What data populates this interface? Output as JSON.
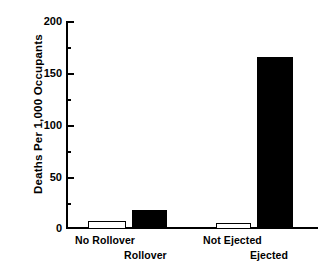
{
  "chart_data": {
    "type": "bar",
    "title": "",
    "xlabel": "",
    "ylabel": "Deaths Per 1,000 Occupants",
    "ylim": [
      0,
      200
    ],
    "grid": false,
    "legend": "none",
    "y_ticks_major": [
      0,
      50,
      100,
      150,
      200
    ],
    "y_ticks_minor": [
      25,
      75,
      125,
      175
    ],
    "categories": [
      "No Rollover",
      "Rollover",
      "Not Ejected",
      "Ejected"
    ],
    "values": [
      8,
      18,
      6,
      167
    ],
    "bar_styles": [
      "open",
      "filled",
      "open",
      "filled"
    ],
    "groups": [
      {
        "name": "Rollover status",
        "categories": [
          "No Rollover",
          "Rollover"
        ],
        "values": [
          8,
          18
        ]
      },
      {
        "name": "Ejection status",
        "categories": [
          "Not Ejected",
          "Ejected"
        ],
        "values": [
          6,
          167
        ]
      }
    ]
  },
  "axis": {
    "y_title": "Deaths Per 1,000 Occupants",
    "y_tick_labels": [
      "200",
      "150",
      "100",
      "50",
      "0"
    ]
  },
  "x_labels": {
    "no_rollover": "No Rollover",
    "rollover": "Rollover",
    "not_ejected": "Not Ejected",
    "ejected": "Ejected"
  },
  "colors": {
    "axis": "#000000",
    "bar_filled": "#000000",
    "bar_open": "#ffffff",
    "background": "#ffffff"
  }
}
